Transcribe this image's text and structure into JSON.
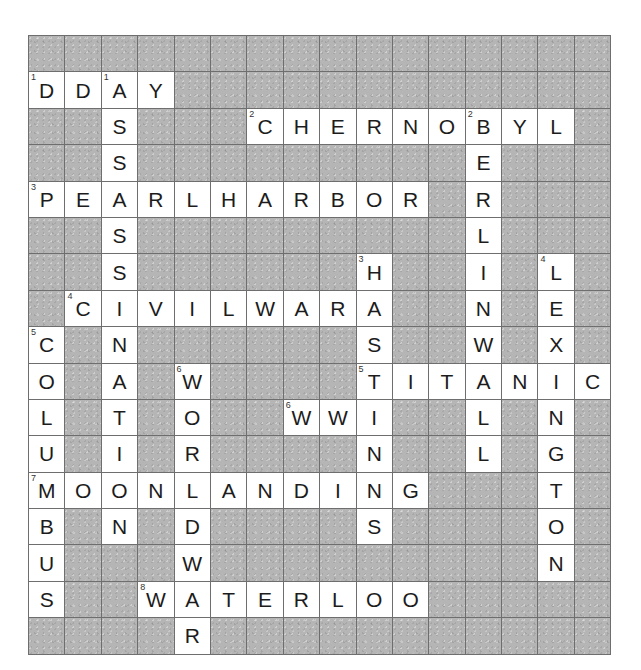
{
  "puzzle": {
    "title": "History Crossword",
    "grid": {
      "columns": 16,
      "rows": 16,
      "cell_size": 36.4,
      "block_color": "#b5b5b5",
      "fill_color": "#ffffff",
      "line_color": "#6e6e6e",
      "letter_color": "#1c1c1c"
    },
    "entries": {
      "across": [
        {
          "number": "1",
          "answer": "DDAY",
          "row": 1,
          "col": 0,
          "length": 4
        },
        {
          "number": "2",
          "answer": "CHERNOBYL",
          "row": 2,
          "col": 6,
          "length": 9
        },
        {
          "number": "3",
          "answer": "PEARLHARBOR",
          "row": 4,
          "col": 0,
          "length": 11
        },
        {
          "number": "4",
          "answer": "CIVILWAR",
          "row": 7,
          "col": 1,
          "length": 8
        },
        {
          "number": "5",
          "answer": "TITANIC",
          "row": 9,
          "col": 9,
          "length": 7
        },
        {
          "number": "6",
          "answer": "WWI",
          "row": 10,
          "col": 7,
          "length": 3
        },
        {
          "number": "7",
          "answer": "MOONLANDING",
          "row": 12,
          "col": 0,
          "length": 11
        },
        {
          "number": "8",
          "answer": "WATERLOO",
          "row": 15,
          "col": 3,
          "length": 8
        }
      ],
      "down": [
        {
          "number": "1",
          "answer": "ASSASSINATION",
          "row": 1,
          "col": 2,
          "length": 13
        },
        {
          "number": "2",
          "answer": "BERLINWALL",
          "row": 2,
          "col": 12,
          "length": 10
        },
        {
          "number": "3",
          "answer": "HASTINGS",
          "row": 6,
          "col": 9,
          "length": 8
        },
        {
          "number": "4",
          "answer": "LEXINGTON",
          "row": 6,
          "col": 14,
          "length": 9
        },
        {
          "number": "5",
          "answer": "COLUMBUS",
          "row": 8,
          "col": 0,
          "length": 8
        },
        {
          "number": "6",
          "answer": "WORLDWAR",
          "row": 9,
          "col": 4,
          "length": 8
        }
      ]
    },
    "cells": [
      [
        null,
        null,
        null,
        null,
        null,
        null,
        null,
        null,
        null,
        null,
        null,
        null,
        null,
        null,
        null,
        null
      ],
      [
        {
          "l": "D",
          "n": "1"
        },
        {
          "l": "D"
        },
        {
          "l": "A",
          "n": "1"
        },
        {
          "l": "Y"
        },
        null,
        null,
        null,
        null,
        null,
        null,
        null,
        null,
        null,
        null,
        null,
        null
      ],
      [
        null,
        null,
        {
          "l": "S"
        },
        null,
        null,
        null,
        {
          "l": "C",
          "n": "2"
        },
        {
          "l": "H"
        },
        {
          "l": "E"
        },
        {
          "l": "R"
        },
        {
          "l": "N"
        },
        {
          "l": "O"
        },
        {
          "l": "B",
          "n": "2"
        },
        {
          "l": "Y"
        },
        {
          "l": "L"
        },
        null
      ],
      [
        null,
        null,
        {
          "l": "S"
        },
        null,
        null,
        null,
        null,
        null,
        null,
        null,
        null,
        null,
        {
          "l": "E"
        },
        null,
        null,
        null
      ],
      [
        {
          "l": "P",
          "n": "3"
        },
        {
          "l": "E"
        },
        {
          "l": "A"
        },
        {
          "l": "R"
        },
        {
          "l": "L"
        },
        {
          "l": "H"
        },
        {
          "l": "A"
        },
        {
          "l": "R"
        },
        {
          "l": "B"
        },
        {
          "l": "O"
        },
        {
          "l": "R"
        },
        null,
        {
          "l": "R"
        },
        null,
        null,
        null
      ],
      [
        null,
        null,
        {
          "l": "S"
        },
        null,
        null,
        null,
        null,
        null,
        null,
        null,
        null,
        null,
        {
          "l": "L"
        },
        null,
        null,
        null
      ],
      [
        null,
        null,
        {
          "l": "S"
        },
        null,
        null,
        null,
        null,
        null,
        null,
        {
          "l": "H",
          "n": "3"
        },
        null,
        null,
        {
          "l": "I"
        },
        null,
        {
          "l": "L",
          "n": "4"
        },
        null
      ],
      [
        null,
        {
          "l": "C",
          "n": "4"
        },
        {
          "l": "I"
        },
        {
          "l": "V"
        },
        {
          "l": "I"
        },
        {
          "l": "L"
        },
        {
          "l": "W"
        },
        {
          "l": "A"
        },
        {
          "l": "R"
        },
        {
          "l": "A"
        },
        null,
        null,
        {
          "l": "N"
        },
        null,
        {
          "l": "E"
        },
        null
      ],
      [
        {
          "l": "C",
          "n": "5"
        },
        null,
        {
          "l": "N"
        },
        null,
        null,
        null,
        null,
        null,
        null,
        {
          "l": "S"
        },
        null,
        null,
        {
          "l": "W"
        },
        null,
        {
          "l": "X"
        },
        null
      ],
      [
        {
          "l": "O"
        },
        null,
        {
          "l": "A"
        },
        null,
        {
          "l": "W",
          "n": "6"
        },
        null,
        null,
        null,
        null,
        {
          "l": "T",
          "n": "5"
        },
        {
          "l": "I"
        },
        {
          "l": "T"
        },
        {
          "l": "A"
        },
        {
          "l": "N"
        },
        {
          "l": "I"
        },
        {
          "l": "C"
        }
      ],
      [
        {
          "l": "L"
        },
        null,
        {
          "l": "T"
        },
        null,
        {
          "l": "O"
        },
        null,
        null,
        {
          "l": "W",
          "n": "6"
        },
        {
          "l": "W"
        },
        {
          "l": "I"
        },
        null,
        null,
        {
          "l": "L"
        },
        null,
        {
          "l": "N"
        },
        null
      ],
      [
        {
          "l": "U"
        },
        null,
        {
          "l": "I"
        },
        null,
        {
          "l": "R"
        },
        null,
        null,
        null,
        null,
        {
          "l": "N"
        },
        null,
        null,
        {
          "l": "L"
        },
        null,
        {
          "l": "G"
        },
        null
      ],
      [
        {
          "l": "M",
          "n": "7"
        },
        {
          "l": "O"
        },
        {
          "l": "O"
        },
        {
          "l": "N"
        },
        {
          "l": "L"
        },
        {
          "l": "A"
        },
        {
          "l": "N"
        },
        {
          "l": "D"
        },
        {
          "l": "I"
        },
        {
          "l": "N"
        },
        {
          "l": "G"
        },
        null,
        null,
        null,
        {
          "l": "T"
        },
        null
      ],
      [
        {
          "l": "B"
        },
        null,
        {
          "l": "N"
        },
        null,
        {
          "l": "D"
        },
        null,
        null,
        null,
        null,
        {
          "l": "S"
        },
        null,
        null,
        null,
        null,
        {
          "l": "O"
        },
        null
      ],
      [
        {
          "l": "U"
        },
        null,
        null,
        null,
        {
          "l": "W"
        },
        null,
        null,
        null,
        null,
        null,
        null,
        null,
        null,
        null,
        {
          "l": "N"
        },
        null
      ],
      [
        {
          "l": "S"
        },
        null,
        null,
        {
          "l": "W",
          "n": "8"
        },
        {
          "l": "A"
        },
        {
          "l": "T"
        },
        {
          "l": "E"
        },
        {
          "l": "R"
        },
        {
          "l": "L"
        },
        {
          "l": "O"
        },
        {
          "l": "O"
        },
        null,
        null,
        null,
        null,
        null
      ],
      [
        null,
        null,
        null,
        null,
        {
          "l": "R"
        },
        null,
        null,
        null,
        null,
        null,
        null,
        null,
        null,
        null,
        null,
        null
      ]
    ]
  }
}
